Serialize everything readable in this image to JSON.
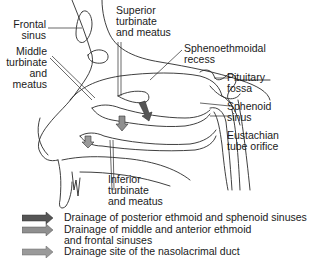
{
  "labels": {
    "frontal_sinus": [
      "Frontal",
      "sinus"
    ],
    "superior_turbinate": [
      "Superior",
      "turbinate",
      "and meatus"
    ],
    "middle_turbinate": [
      "Middle",
      "turbinate",
      "and",
      "meatus"
    ],
    "sphenoethmoidal_recess": [
      "Sphenoethmoidal",
      "recess"
    ],
    "pituitary_fossa": [
      "Pituitary",
      "fossa"
    ],
    "sphenoid_sinus": [
      "Sphenoid",
      "sinus"
    ],
    "eustachian_tube": [
      "Eustachian",
      "tube orifice"
    ],
    "inferior_turbinate": [
      "Inferior",
      "turbinate",
      "and meatus"
    ]
  },
  "legend": [
    {
      "lines": [
        "Drainage of posterior ethmoid and sphenoid sinuses"
      ],
      "color": "#555555"
    },
    {
      "lines": [
        "Drainage of middle and anterior ethmoid",
        "and frontal sinuses"
      ],
      "color": "#8f8f8f"
    },
    {
      "lines": [
        "Drainage site of the nasolacrimal duct"
      ],
      "color": "#9a9a9a"
    }
  ],
  "colors": {
    "dark_arrow": "#555555",
    "mid_arrow": "#8f8f8f",
    "light_arrow": "#9a9a9a",
    "line": "#2a2a2a"
  }
}
